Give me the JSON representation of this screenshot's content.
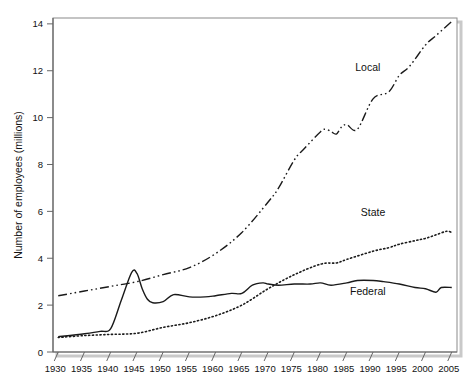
{
  "chart_data": {
    "type": "line",
    "title": "",
    "xlabel": "",
    "ylabel": "Number of employees (millions)",
    "xlim": [
      1929,
      2006
    ],
    "ylim": [
      0,
      14.25
    ],
    "xticks": [
      1930,
      1935,
      1940,
      1945,
      1950,
      1955,
      1960,
      1965,
      1970,
      1975,
      1980,
      1985,
      1990,
      1995,
      2000,
      2005
    ],
    "xtick_labels": [
      "1930",
      "1935",
      "1940",
      "1945",
      "1950",
      "1955",
      "1960",
      "1965",
      "1970",
      "1975",
      "1980",
      "1985",
      "1990",
      "1995",
      "2000",
      "2005"
    ],
    "yticks": [
      0,
      2,
      4,
      6,
      8,
      10,
      12,
      14
    ],
    "ytick_labels": [
      "0",
      "2",
      "4",
      "6",
      "8",
      "10",
      "12",
      "14"
    ],
    "grid": false,
    "legend_position": "inline-annotations",
    "series": [
      {
        "name": "Local",
        "label": "Local",
        "style": "dash-dot-dot",
        "color": "#1a1a1a",
        "label_x": 1989,
        "label_y": 12.0,
        "x": [
          1930,
          1935,
          1940,
          1945,
          1950,
          1955,
          1960,
          1965,
          1970,
          1972,
          1975,
          1977,
          1980,
          1981,
          1982,
          1983,
          1984,
          1985,
          1987,
          1990,
          1993,
          1995,
          1997,
          2000,
          2002,
          2005
        ],
        "y": [
          2.4,
          2.6,
          2.8,
          3.0,
          3.3,
          3.6,
          4.2,
          5.1,
          6.4,
          7.0,
          8.2,
          8.7,
          9.4,
          9.5,
          9.4,
          9.3,
          9.6,
          9.7,
          9.5,
          10.8,
          11.1,
          11.8,
          12.2,
          13.1,
          13.5,
          14.1
        ]
      },
      {
        "name": "State",
        "label": "State",
        "style": "dotted",
        "color": "#1a1a1a",
        "label_x": 1990,
        "label_y": 5.8,
        "x": [
          1930,
          1935,
          1940,
          1945,
          1950,
          1955,
          1960,
          1965,
          1970,
          1975,
          1980,
          1983,
          1985,
          1990,
          1993,
          1995,
          1998,
          2000,
          2002,
          2004,
          2005
        ],
        "y": [
          0.62,
          0.7,
          0.75,
          0.8,
          1.05,
          1.25,
          1.55,
          2.0,
          2.7,
          3.3,
          3.75,
          3.8,
          3.95,
          4.3,
          4.45,
          4.6,
          4.75,
          4.85,
          5.0,
          5.15,
          5.1
        ]
      },
      {
        "name": "Federal",
        "label": "Federal",
        "style": "solid",
        "color": "#1a1a1a",
        "label_x": 1989,
        "label_y": 2.45,
        "x": [
          1930,
          1935,
          1938,
          1940,
          1942,
          1944,
          1945,
          1946,
          1947,
          1948,
          1950,
          1952,
          1955,
          1958,
          1960,
          1963,
          1965,
          1967,
          1969,
          1970,
          1972,
          1975,
          1978,
          1980,
          1982,
          1985,
          1987,
          1990,
          1992,
          1995,
          1998,
          2000,
          2002,
          2003,
          2005
        ],
        "y": [
          0.65,
          0.78,
          0.88,
          1.0,
          2.2,
          3.4,
          3.35,
          2.7,
          2.25,
          2.1,
          2.15,
          2.45,
          2.35,
          2.35,
          2.4,
          2.5,
          2.5,
          2.85,
          2.95,
          2.9,
          2.85,
          2.9,
          2.9,
          2.95,
          2.85,
          2.95,
          3.05,
          3.05,
          3.0,
          2.9,
          2.75,
          2.7,
          2.55,
          2.75,
          2.75
        ]
      }
    ]
  },
  "axis": {
    "y_axis_title": "Number of employees (millions)"
  }
}
